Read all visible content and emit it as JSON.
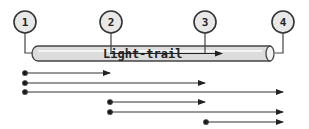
{
  "diagram": {
    "title": "Light-trail",
    "nodes": [
      {
        "label": "1",
        "x": 25
      },
      {
        "label": "2",
        "x": 111
      },
      {
        "label": "3",
        "x": 205
      },
      {
        "label": "4",
        "x": 283
      }
    ],
    "connections": [
      {
        "from": "1",
        "to": "2"
      },
      {
        "from": "1",
        "to": "3"
      },
      {
        "from": "1",
        "to": "4"
      },
      {
        "from": "2",
        "to": "3"
      },
      {
        "from": "2",
        "to": "4"
      },
      {
        "from": "3",
        "to": "4"
      }
    ],
    "colors": {
      "stroke": "#333333",
      "tube_fill": "#dcdcdc",
      "node_fill": "#e8e8e8"
    }
  }
}
